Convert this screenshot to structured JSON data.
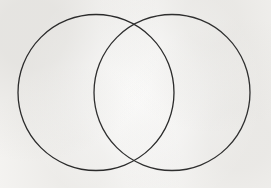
{
  "figure": {
    "title": "",
    "type": "venn-diagram",
    "width": 271,
    "height": 188,
    "background_color": "#f6f5f3",
    "stroke_color": "#2b2b2b",
    "stroke_width": 1.3,
    "set_count": 2,
    "fill": "none",
    "labels_present": false,
    "circles": [
      {
        "name": "left-set",
        "label": "",
        "cx": 96,
        "cy": 92.5,
        "r": 78,
        "stroke_color": "#2b2b2b",
        "stroke_width": 1.3,
        "fill": "none"
      },
      {
        "name": "right-set",
        "label": "",
        "cx": 172,
        "cy": 92.5,
        "r": 78,
        "stroke_color": "#2f2f2f",
        "stroke_width": 1.3,
        "fill": "none"
      }
    ],
    "intersections": [
      {
        "name": "top-intersection",
        "x": 134,
        "y": 16
      },
      {
        "name": "bottom-intersection",
        "x": 134,
        "y": 169
      }
    ],
    "regions": [
      {
        "name": "left-only-region",
        "label": ""
      },
      {
        "name": "intersection-region",
        "label": ""
      },
      {
        "name": "right-only-region",
        "label": ""
      }
    ]
  }
}
